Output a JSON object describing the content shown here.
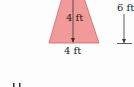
{
  "diagram": {
    "shape": "trapezoid",
    "fill_color": "#f29a9a",
    "stroke_color": "#c85a5a",
    "labels": {
      "height_inner": "4 ft",
      "bottom_width": "4 ft",
      "right_dimension": "6 ft"
    },
    "bottom_partial_glyph": "I I"
  }
}
